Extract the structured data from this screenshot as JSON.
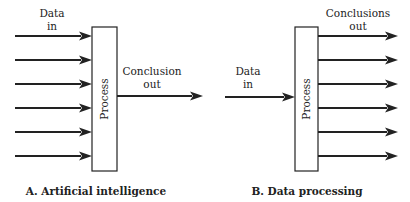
{
  "panel_a": {
    "caption": "A. Artificial intelligence",
    "input_label_line1": "Data",
    "input_label_line2": "in",
    "process_label": "Process",
    "output_label_line1": "Conclusion",
    "output_label_line2": "out",
    "input_count": 6,
    "output_count": 1
  },
  "panel_b": {
    "caption": "B. Data processing",
    "input_label_line1": "Data",
    "input_label_line2": "in",
    "process_label": "Process",
    "output_label_line1": "Conclusions",
    "output_label_line2": "out",
    "input_count": 1,
    "output_count": 6
  }
}
